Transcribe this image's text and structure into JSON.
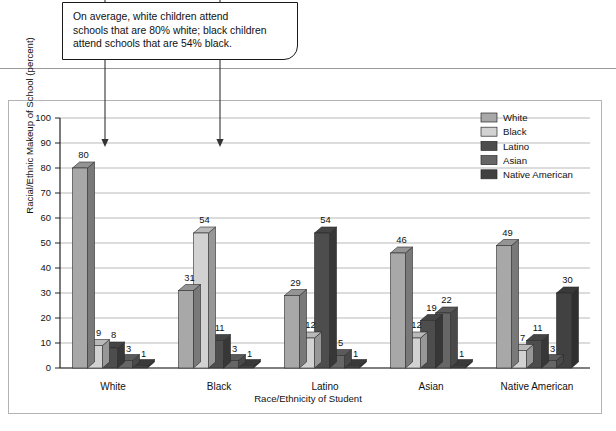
{
  "callout": {
    "lines": [
      "On average, white children attend",
      "schools that are 80% white; black children",
      "attend schools that are 54% black."
    ]
  },
  "chart_data": {
    "type": "bar",
    "title": "",
    "xlabel": "Race/Ethnicity of Student",
    "ylabel": "Racial/Ethnic Makeup of School (percent)",
    "categories": [
      "White",
      "Black",
      "Latino",
      "Asian",
      "Native American"
    ],
    "ylim": [
      0,
      100
    ],
    "yticks": [
      0,
      10,
      20,
      30,
      40,
      50,
      60,
      70,
      80,
      90,
      100
    ],
    "grid": true,
    "legend_position": "top-right",
    "series": [
      {
        "name": "White",
        "color": "#a8a8a8",
        "values": [
          80,
          31,
          29,
          46,
          49
        ]
      },
      {
        "name": "Black",
        "color": "#d2d2d2",
        "values": [
          9,
          54,
          12,
          12,
          7
        ]
      },
      {
        "name": "Latino",
        "color": "#4d4d4d",
        "values": [
          8,
          11,
          54,
          19,
          11
        ]
      },
      {
        "name": "Asian",
        "color": "#666666",
        "values": [
          3,
          3,
          5,
          22,
          3
        ]
      },
      {
        "name": "Native American",
        "color": "#414141",
        "values": [
          1,
          1,
          1,
          1,
          30
        ]
      }
    ]
  },
  "annotations": {
    "arrows": [
      {
        "name": "arrow-to-white-bar",
        "x": 105,
        "label_target": "80"
      },
      {
        "name": "arrow-to-black-bar",
        "x": 220,
        "label_target": "54"
      }
    ]
  }
}
